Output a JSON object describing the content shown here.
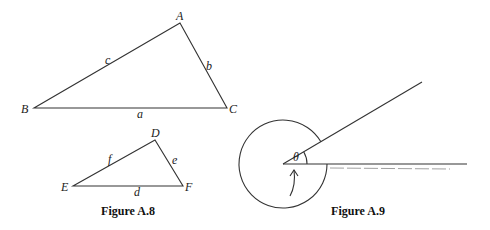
{
  "figure_a8": {
    "caption": "Figure A.8",
    "triangle_large": {
      "vertices": {
        "A": "A",
        "B": "B",
        "C": "C"
      },
      "sides": {
        "a": "a",
        "b": "b",
        "c": "c"
      }
    },
    "triangle_small": {
      "vertices": {
        "D": "D",
        "E": "E",
        "F": "F"
      },
      "sides": {
        "d": "d",
        "e": "e",
        "f": "f"
      }
    }
  },
  "figure_a9": {
    "caption": "Figure A.9",
    "angle_label": "θ"
  }
}
